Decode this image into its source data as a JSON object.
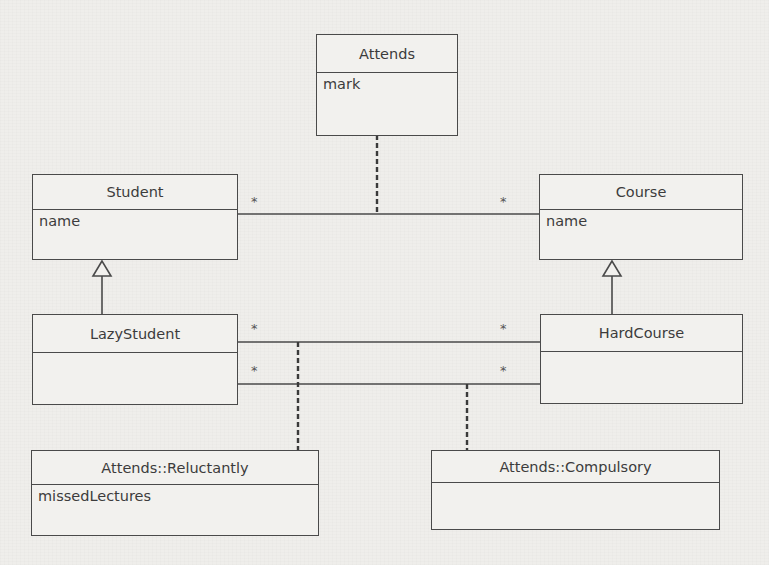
{
  "diagram": {
    "type": "UML class diagram",
    "classes": [
      {
        "id": "attends",
        "name": "Attends",
        "attributes": [
          "mark"
        ]
      },
      {
        "id": "student",
        "name": "Student",
        "attributes": [
          "name"
        ]
      },
      {
        "id": "course",
        "name": "Course",
        "attributes": [
          "name"
        ]
      },
      {
        "id": "lazystudent",
        "name": "LazyStudent",
        "attributes": []
      },
      {
        "id": "hardcourse",
        "name": "HardCourse",
        "attributes": []
      },
      {
        "id": "reluctantly",
        "name": "Attends::Reluctantly",
        "attributes": [
          "missedLectures"
        ]
      },
      {
        "id": "compulsory",
        "name": "Attends::Compulsory",
        "attributes": []
      }
    ],
    "associations": [
      {
        "from": "Student",
        "to": "Course",
        "from_mult": "*",
        "to_mult": "*",
        "association_class": "Attends"
      },
      {
        "from": "LazyStudent",
        "to": "HardCourse",
        "from_mult": "*",
        "to_mult": "*",
        "association_class": "Attends::Reluctantly"
      },
      {
        "from": "LazyStudent",
        "to": "HardCourse",
        "from_mult": "*",
        "to_mult": "*",
        "association_class": "Attends::Compulsory"
      }
    ],
    "generalizations": [
      {
        "child": "LazyStudent",
        "parent": "Student"
      },
      {
        "child": "HardCourse",
        "parent": "Course"
      }
    ]
  },
  "labels": {
    "mult_star": "*"
  },
  "colors": {
    "paper": "#efeeeb",
    "ink": "#4a4a4a"
  }
}
